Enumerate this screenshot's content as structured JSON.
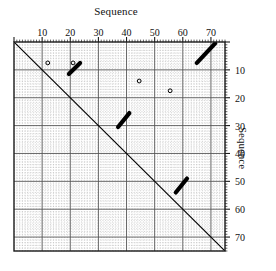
{
  "figure": {
    "top_axis_title": "Sequence",
    "right_axis_title": "Sequence"
  },
  "chart_data": {
    "type": "scatter",
    "title": "Sequence",
    "subtitle": "",
    "xlabel": "Sequence",
    "ylabel": "Sequence",
    "xlabel_position": "top",
    "ylabel_position": "right",
    "xlim": [
      0,
      75
    ],
    "ylim": [
      0,
      75
    ],
    "y_axis_direction": "top-to-bottom",
    "grid": true,
    "grid_minor_step": 1,
    "grid_major_step": 10,
    "grid_minor_style": "dotted",
    "grid_major_style": "solid",
    "legend": "none",
    "xticks": [
      10,
      20,
      30,
      40,
      50,
      60,
      70
    ],
    "xtick_labels": [
      "10",
      "20",
      "30",
      "40",
      "50",
      "60",
      "70"
    ],
    "yticks": [
      10,
      20,
      30,
      40,
      50,
      60,
      70
    ],
    "ytick_labels": [
      "10",
      "20",
      "30",
      "40",
      "50",
      "60",
      "70"
    ],
    "minor_tick_step": 1,
    "series": [
      {
        "name": "main-diagonal",
        "kind": "segment",
        "style": "thin-solid-black",
        "points": [
          [
            0,
            0
          ],
          [
            75,
            75
          ]
        ]
      },
      {
        "name": "repeat-segment-1",
        "kind": "segment",
        "style": "thick-solid-black",
        "points": [
          [
            19.5,
            11.5
          ],
          [
            23.5,
            7.5
          ]
        ]
      },
      {
        "name": "repeat-segment-2",
        "kind": "segment",
        "style": "thick-solid-black",
        "points": [
          [
            37.0,
            30.5
          ],
          [
            41.0,
            25.5
          ]
        ]
      },
      {
        "name": "repeat-segment-3",
        "kind": "segment",
        "style": "thick-solid-black",
        "points": [
          [
            57.5,
            54.0
          ],
          [
            61.5,
            49.0
          ]
        ]
      },
      {
        "name": "repeat-segment-4",
        "kind": "segment",
        "style": "thick-solid-black",
        "points": [
          [
            65.0,
            7.5
          ],
          [
            71.5,
            0.5
          ]
        ]
      },
      {
        "name": "isolated-dots",
        "kind": "markers",
        "style": "small-open-circle",
        "points": [
          [
            12.0,
            7.5
          ],
          [
            21.0,
            7.5
          ],
          [
            44.5,
            14.0
          ],
          [
            55.5,
            17.5
          ]
        ]
      }
    ],
    "colors": {
      "line": "#000000",
      "grid_minor": "#b9b9b9",
      "grid_major": "#555555",
      "frame": "#1a1a1a",
      "background": "#ffffff",
      "text": "#111111"
    }
  }
}
